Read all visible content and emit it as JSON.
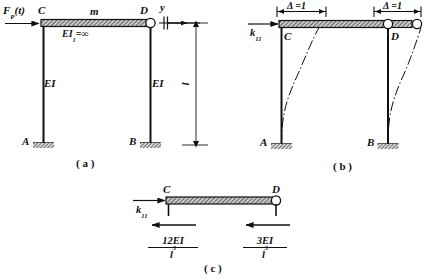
{
  "figure": {
    "caption_a": "( a )",
    "caption_b": "( b )",
    "caption_c": "( c )",
    "ink_color": "#111111",
    "background_color": "#ffffff",
    "beam_fill_color": "#b8b8b8"
  },
  "panel_a": {
    "name": "two-bay portal frame with rigid beam",
    "force_label": "F",
    "force_sub": "P",
    "force_arg": "(t)",
    "node_c": "C",
    "node_d": "D",
    "support_a": "A",
    "support_b": "B",
    "mass_label": "m",
    "beam_stiffness": "EI",
    "beam_stiffness_sub": "1",
    "beam_stiffness_value": "=∞",
    "column_left_stiffness": "EI",
    "column_right_stiffness": "EI",
    "coordinate_label": "y",
    "height_label": "l"
  },
  "panel_b": {
    "name": "unit displacement state with stiffness coefficient",
    "stiffness_label": "k",
    "stiffness_sub": "11",
    "node_c": "C",
    "node_d": "D",
    "support_a": "A",
    "support_b": "B",
    "delta_left": "Δ =1",
    "delta_right": "Δ =1"
  },
  "panel_c": {
    "name": "free body of rigid beam with column shears",
    "stiffness_label": "k",
    "stiffness_sub": "11",
    "node_c": "C",
    "node_d": "D",
    "left_reaction_num": "12EI",
    "left_reaction_den": "l",
    "left_reaction_den_exp": "3",
    "right_reaction_num": "3EI",
    "right_reaction_den": "l",
    "right_reaction_den_exp": "3"
  }
}
